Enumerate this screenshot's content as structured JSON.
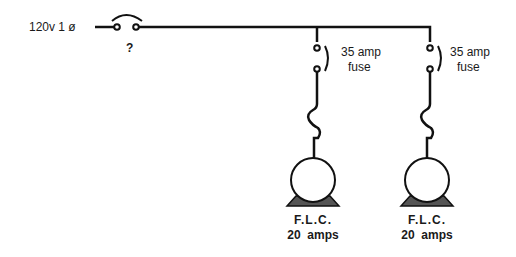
{
  "diagram": {
    "supply_label": "120v  1 ø",
    "main_switch_label": "?",
    "branches": [
      {
        "fuse_label_line1": "35 amp",
        "fuse_label_line2": "fuse",
        "motor_label_line1": "F.L.C.",
        "motor_label_line2": "20  amps"
      },
      {
        "fuse_label_line1": "35 amp",
        "fuse_label_line2": "fuse",
        "motor_label_line1": "F.L.C.",
        "motor_label_line2": "20  amps"
      }
    ],
    "colors": {
      "line": "#111111",
      "motor_base": "#555555"
    }
  }
}
